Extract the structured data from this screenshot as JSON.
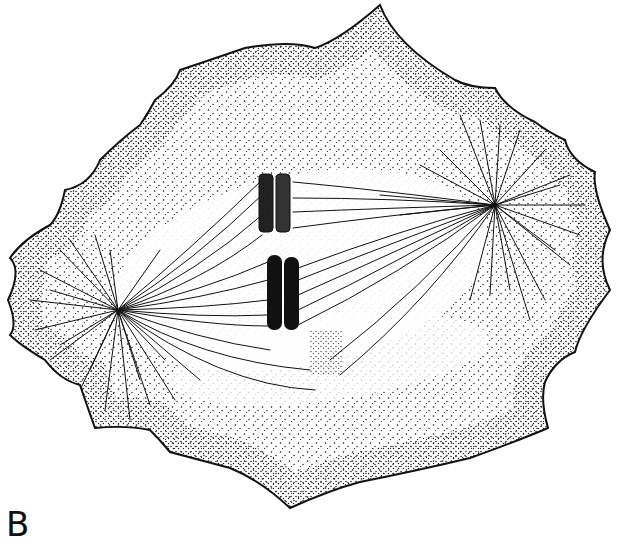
{
  "figure": {
    "panel_label": "B",
    "colors": {
      "ink": "#111111",
      "background": "#ffffff"
    },
    "elements": [
      {
        "name": "cell-membrane",
        "description": "scalloped cell outline"
      },
      {
        "name": "cytoplasm-stipple",
        "description": "stippled cytoplasm"
      },
      {
        "name": "left-aster",
        "center": [
          118,
          310
        ]
      },
      {
        "name": "right-aster",
        "center": [
          495,
          205
        ]
      },
      {
        "name": "spindle-fibers",
        "description": "microtubules between poles"
      },
      {
        "name": "chromosome-pair-stippled",
        "position": [
          277,
          210
        ]
      },
      {
        "name": "chromosome-pair-solid",
        "position": [
          280,
          295
        ]
      }
    ]
  }
}
